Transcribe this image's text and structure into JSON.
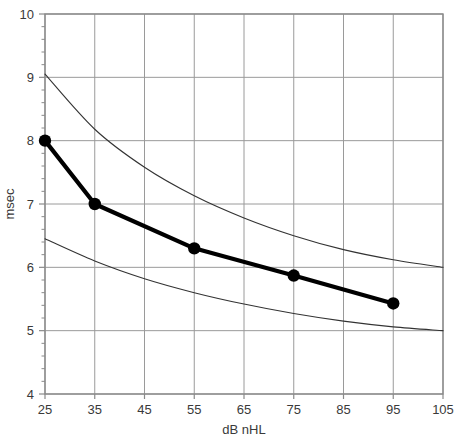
{
  "chart_data": {
    "type": "line",
    "title": "",
    "xlabel": "dB nHL",
    "ylabel": "msec",
    "xlim": [
      25,
      105
    ],
    "ylim": [
      4,
      10
    ],
    "xticks": [
      25,
      35,
      45,
      55,
      65,
      75,
      85,
      95,
      105
    ],
    "yticks": [
      4,
      5,
      6,
      7,
      8,
      9,
      10
    ],
    "x_minor_step": 0,
    "y_minor_step": 0.2,
    "grid": true,
    "legend": "none",
    "series": [
      {
        "name": "mean latency",
        "style": "thick-line-with-markers",
        "color": "#000000",
        "x": [
          25,
          35,
          55,
          75,
          95
        ],
        "values": [
          8.0,
          7.0,
          6.3,
          5.87,
          5.43
        ]
      },
      {
        "name": "upper bound",
        "style": "thin-curve",
        "color": "#333333",
        "x": [
          25,
          35,
          45,
          55,
          65,
          75,
          85,
          95,
          105
        ],
        "values": [
          9.05,
          8.18,
          7.58,
          7.13,
          6.78,
          6.5,
          6.28,
          6.12,
          6.0
        ]
      },
      {
        "name": "lower bound",
        "style": "thin-curve",
        "color": "#333333",
        "x": [
          25,
          35,
          45,
          55,
          65,
          75,
          85,
          95,
          105
        ],
        "values": [
          6.45,
          6.1,
          5.82,
          5.6,
          5.42,
          5.27,
          5.15,
          5.06,
          5.0
        ]
      }
    ]
  },
  "axes": {
    "x_tick_labels": [
      "25",
      "35",
      "45",
      "55",
      "65",
      "75",
      "85",
      "95",
      "105"
    ],
    "y_tick_labels": [
      "4",
      "5",
      "6",
      "7",
      "8",
      "9",
      "10"
    ],
    "x_axis_title": "dB nHL",
    "y_axis_title": "msec"
  },
  "colors": {
    "grid": "#9a9a9a",
    "frame": "#8a8a8a",
    "data_line": "#000000",
    "envelope": "#3c3c3c",
    "text": "#3a3a3a",
    "background": "#ffffff"
  }
}
